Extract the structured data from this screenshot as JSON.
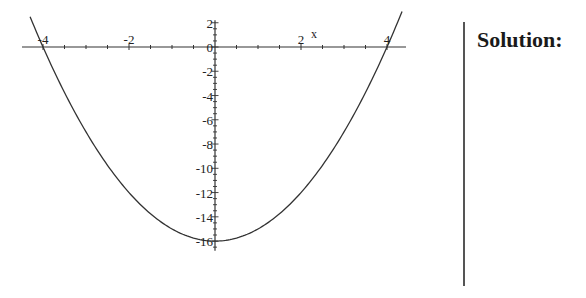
{
  "chart_data": {
    "type": "line",
    "title": "",
    "function": "y = x^2 - 16",
    "xlabel": "x",
    "ylabel": "",
    "xlim": [
      -4.4,
      4.6
    ],
    "ylim": [
      -16.8,
      2.2
    ],
    "x_ticks": [
      -4,
      -2,
      2,
      4
    ],
    "x_tick_labels": [
      "-4",
      "-2",
      "2",
      "4"
    ],
    "y_ticks": [
      2,
      0,
      -2,
      -4,
      -6,
      -8,
      -10,
      -12,
      -14,
      -16
    ],
    "y_tick_labels": [
      "2",
      "0",
      "-2",
      "-4",
      "-6",
      "-8",
      "-10",
      "-12",
      "-14",
      "-16"
    ],
    "grid": false,
    "legend": null,
    "series": [
      {
        "name": "parabola",
        "x": [
          -4.3,
          -4,
          -3,
          -2,
          -1,
          0,
          1,
          2,
          3,
          4,
          4.35
        ],
        "y": [
          2.49,
          0,
          -7,
          -12,
          -15,
          -16,
          -15,
          -12,
          -7,
          0,
          2.92
        ]
      }
    ],
    "annotations": [
      {
        "text": "x-intercepts",
        "points": [
          [
            -4,
            0
          ],
          [
            4,
            0
          ]
        ]
      },
      {
        "text": "vertex",
        "point": [
          0,
          -16
        ]
      }
    ]
  },
  "side_panel": {
    "heading": "Solution:"
  }
}
